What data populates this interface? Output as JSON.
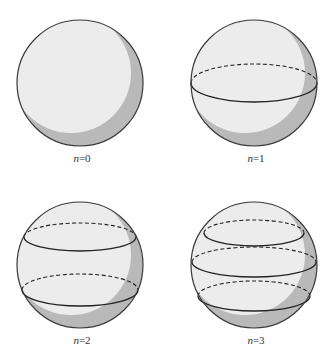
{
  "figure": {
    "panels": [
      {
        "n": 0,
        "label_var": "n",
        "label_eq": "=0",
        "cx": 80,
        "cy": 83,
        "r": 63,
        "rings": []
      },
      {
        "n": 1,
        "label_var": "n",
        "label_eq": "=1",
        "cx": 254,
        "cy": 83,
        "r": 63,
        "rings": [
          {
            "cy": 83,
            "rx": 63,
            "ry": 19
          }
        ]
      },
      {
        "n": 2,
        "label_var": "n",
        "label_eq": "=2",
        "cx": 80,
        "cy": 265,
        "r": 63,
        "rings": [
          {
            "cy": 237,
            "rx": 56,
            "ry": 14
          },
          {
            "cy": 290,
            "rx": 58,
            "ry": 16
          }
        ]
      },
      {
        "n": 3,
        "label_var": "n",
        "label_eq": "=3",
        "cx": 254,
        "cy": 265,
        "r": 63,
        "rings": [
          {
            "cy": 233,
            "rx": 50,
            "ry": 13
          },
          {
            "cy": 262,
            "rx": 62,
            "ry": 15
          },
          {
            "cy": 296,
            "rx": 56,
            "ry": 15
          }
        ]
      }
    ],
    "colors": {
      "sphere_fill": "#ececec",
      "shadow": "#b9b9b9",
      "outline": "#3a3a3a",
      "ring": "#222222"
    }
  }
}
